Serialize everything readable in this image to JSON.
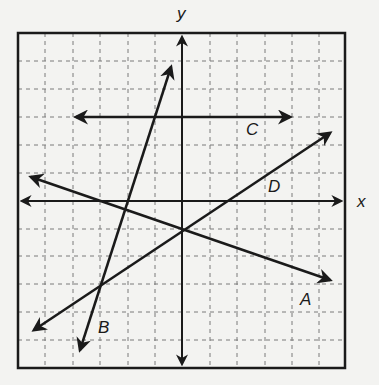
{
  "figure": {
    "type": "coordinate-plane-with-lines",
    "axis_labels": {
      "x": "x",
      "y": "y"
    },
    "grid": {
      "columns": 12,
      "rows": 12,
      "style": "dashed"
    },
    "colors": {
      "background": "#f3f3f1",
      "ink": "#1a1a1a",
      "grid": "#777777"
    },
    "lines": [
      {
        "label": "A",
        "description": "decreasing line, negative slope, passes through origin-area below x-axis",
        "arrow_start": [
          31,
          177
        ],
        "arrow_end": [
          330,
          280
        ],
        "label_pos": [
          300,
          305
        ]
      },
      {
        "label": "B",
        "description": "steep increasing line",
        "arrow_start": [
          80,
          350
        ],
        "arrow_end": [
          171,
          67
        ],
        "label_pos": [
          98,
          333
        ]
      },
      {
        "label": "C",
        "description": "horizontal line above x-axis",
        "arrow_start": [
          76,
          117
        ],
        "arrow_end": [
          290,
          117
        ],
        "label_pos": [
          246,
          135
        ]
      },
      {
        "label": "D",
        "description": "increasing line, positive slope",
        "arrow_start": [
          34,
          330
        ],
        "arrow_end": [
          330,
          133
        ],
        "label_pos": [
          268,
          192
        ]
      }
    ]
  }
}
